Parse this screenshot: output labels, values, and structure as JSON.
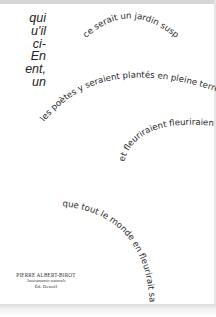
{
  "prose": {
    "lines": [
      "qui",
      "u'il",
      "ci-",
      "En",
      "ent,",
      "un"
    ]
  },
  "poem": {
    "lines": [
      "ce serait un jardin suspendu",
      "les poètes y seraient plantés en pleine terre",
      "et fleuriraient fleuriraient",
      "que tout le monde en fleurirait sa boutonnière"
    ]
  },
  "credit": {
    "author": "PIERRE ALBERT-BIROT",
    "title": "Amusements naturels",
    "publisher": "Éd. Denoël"
  }
}
